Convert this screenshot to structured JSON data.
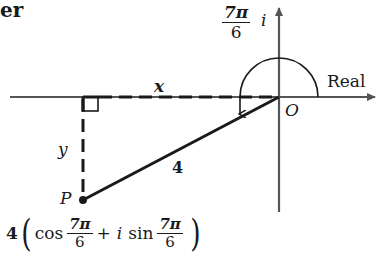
{
  "fragment_text": "er",
  "axes": {
    "real_label": "Real",
    "imaginary_label": "i",
    "origin_label": "O"
  },
  "angle": {
    "numerator": "7π",
    "denominator": "6"
  },
  "triangle": {
    "x_label": "x",
    "y_label": "y",
    "hypotenuse_label": "4",
    "point_label": "P"
  },
  "formula": {
    "coefficient": "4",
    "cos": "cos",
    "plus": "+",
    "i": "i",
    "sin": "sin",
    "frac1_num": "7π",
    "frac1_den": "6",
    "frac2_num": "7π",
    "frac2_den": "6"
  },
  "colors": {
    "ink": "#1a1a1a",
    "axis": "#555555",
    "background": "#ffffff"
  }
}
